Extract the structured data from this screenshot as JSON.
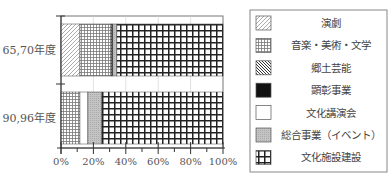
{
  "chart_data": {
    "type": "bar",
    "orientation": "horizontal",
    "stacked": true,
    "normalized": true,
    "title": "",
    "xlabel": "",
    "ylabel": "",
    "xlim": [
      0,
      100
    ],
    "x_tick_labels": [
      "0%",
      "20%",
      "40%",
      "60%",
      "80%",
      "100%"
    ],
    "grid": true,
    "legend_position": "right",
    "categories": [
      "65,70年度",
      "90,96年度"
    ],
    "series": [
      {
        "name": "演劇",
        "pattern": "diagonal-light",
        "values": [
          11.7,
          0
        ]
      },
      {
        "name": "音楽・美術・文学",
        "pattern": "fine-grid",
        "values": [
          19.1,
          11.7
        ]
      },
      {
        "name": "郷土芸能",
        "pattern": "diagonal-dense",
        "values": [
          0.6,
          0
        ]
      },
      {
        "name": "顕彰事業",
        "pattern": "solid-black",
        "values": [
          0.6,
          0
        ]
      },
      {
        "name": "文化講演会",
        "pattern": "white",
        "values": [
          0,
          4.9
        ]
      },
      {
        "name": "総合事業（イベント）",
        "pattern": "gray-dots",
        "values": [
          2.5,
          8.6
        ]
      },
      {
        "name": "文化施設建設",
        "pattern": "bold-grid",
        "values": [
          65.5,
          74.8
        ]
      }
    ]
  }
}
